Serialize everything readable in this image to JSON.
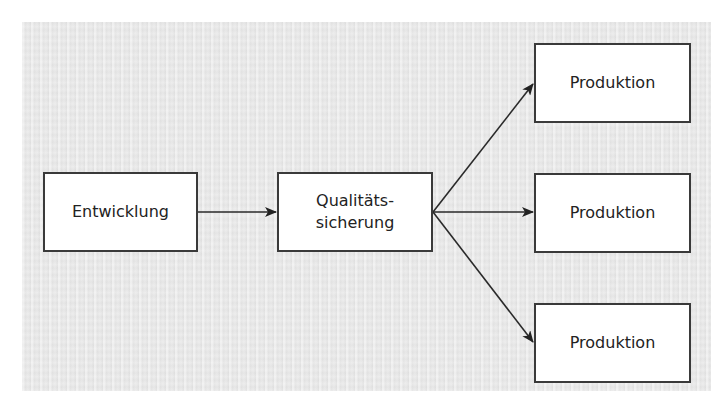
{
  "diagram": {
    "type": "flowchart",
    "background_color": "#e9e9e9",
    "border_color": "#3a3a3a",
    "nodes": [
      {
        "id": "entwicklung",
        "label": "Entwicklung"
      },
      {
        "id": "qs",
        "label_line1": "Qualitäts-",
        "label_line2": "sicherung"
      },
      {
        "id": "produktion1",
        "label": "Produktion"
      },
      {
        "id": "produktion2",
        "label": "Produktion"
      },
      {
        "id": "produktion3",
        "label": "Produktion"
      }
    ],
    "edges": [
      {
        "from": "entwicklung",
        "to": "qs"
      },
      {
        "from": "qs",
        "to": "produktion1"
      },
      {
        "from": "qs",
        "to": "produktion2"
      },
      {
        "from": "qs",
        "to": "produktion3"
      }
    ]
  }
}
